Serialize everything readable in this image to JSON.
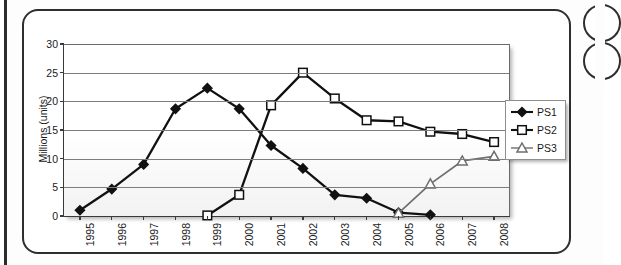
{
  "figure": {
    "artifact_blobs": 2,
    "border_color": "#2e2e2e"
  },
  "legend": {
    "position": "right",
    "entries": [
      {
        "label": "PS1",
        "marker": "filled-diamond",
        "color": "#111111"
      },
      {
        "label": "PS2",
        "marker": "open-square",
        "color": "#111111"
      },
      {
        "label": "PS3",
        "marker": "open-triangle",
        "color": "#6e6e6e"
      }
    ]
  },
  "chart_data": {
    "type": "line",
    "title": "",
    "xlabel": "",
    "ylabel": "Millions (units)",
    "categories": [
      "1995",
      "1996",
      "1997",
      "1998",
      "1999",
      "2000",
      "2001",
      "2002",
      "2003",
      "2004",
      "2005",
      "2006",
      "2007",
      "2008"
    ],
    "ylim": [
      0,
      30
    ],
    "yticks": [
      0,
      5,
      10,
      15,
      20,
      25,
      30
    ],
    "ytick_labels": [
      "0",
      "5",
      "10",
      "15",
      "20",
      "25",
      "30"
    ],
    "grid": true,
    "legend_position": "right",
    "series": [
      {
        "name": "PS1",
        "marker": "filled-diamond",
        "color": "#111111",
        "values": [
          1.0,
          4.7,
          9.0,
          18.7,
          22.3,
          18.7,
          12.3,
          8.3,
          3.7,
          3.1,
          0.6,
          0.2,
          null,
          null
        ]
      },
      {
        "name": "PS2",
        "marker": "open-square",
        "color": "#111111",
        "values": [
          null,
          null,
          null,
          null,
          0.1,
          3.7,
          19.3,
          25.0,
          20.5,
          16.7,
          16.5,
          14.7,
          14.3,
          12.9
        ]
      },
      {
        "name": "PS3",
        "marker": "open-triangle",
        "color": "#6e6e6e",
        "values": [
          null,
          null,
          null,
          null,
          null,
          null,
          null,
          null,
          null,
          null,
          0.5,
          5.6,
          9.6,
          10.4
        ]
      }
    ]
  }
}
